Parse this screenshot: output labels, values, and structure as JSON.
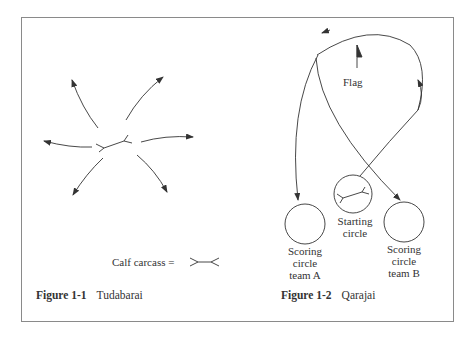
{
  "figures": [
    {
      "id": "1-1",
      "caption_number": "Figure 1-1",
      "caption_title": "Tudabarai",
      "legend": {
        "label": "Calf carcass ="
      }
    },
    {
      "id": "1-2",
      "caption_number": "Figure 1-2",
      "caption_title": "Qarajai",
      "labels": {
        "flag": "Flag",
        "starting_line1": "Starting",
        "starting_line2": "circle",
        "teamA_line1": "Scoring",
        "teamA_line2": "circle",
        "teamA_line3": "team A",
        "teamB_line1": "Scoring",
        "teamB_line2": "circle",
        "teamB_line3": "team B"
      }
    }
  ],
  "colors": {
    "line": "#333333",
    "border": "#8a8a8a",
    "background": "#ffffff"
  }
}
